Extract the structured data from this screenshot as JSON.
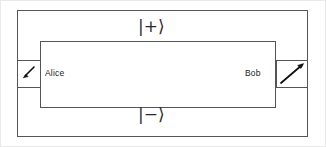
{
  "figure": {
    "name": "quantum-channel-diagram",
    "width": 326,
    "height": 147,
    "background_color": "#ffffff",
    "stroke_color": "#555555",
    "text_color": "#1a1a1a"
  },
  "parties": {
    "alice": {
      "label": "Alice",
      "device_icon": "arrow-down-left-icon",
      "device_arrow_direction": "down-left",
      "box": {
        "x": 17,
        "y": 60,
        "width": 23,
        "height": 28
      }
    },
    "bob": {
      "label": "Bob",
      "device_icon": "arrow-up-right-icon",
      "device_arrow_direction": "up-right",
      "box": {
        "x": 276,
        "y": 60,
        "width": 32,
        "height": 28
      }
    }
  },
  "states": {
    "top": {
      "label": "|+⟩",
      "name": "ket-plus",
      "bar": "|",
      "sign": "+",
      "bracket": "⟩"
    },
    "bottom": {
      "label": "|−⟩",
      "name": "ket-minus",
      "bar": "|",
      "sign": "−",
      "bracket": "⟩"
    }
  },
  "paths": {
    "outer_loop": {
      "name": "outer-path-loop",
      "x": 17,
      "y": 10,
      "width": 291,
      "height": 127,
      "carries_state": "|+⟩ / |−⟩"
    },
    "inner_loop": {
      "name": "inner-path-loop",
      "x": 40,
      "y": 41,
      "width": 236,
      "height": 67
    }
  }
}
